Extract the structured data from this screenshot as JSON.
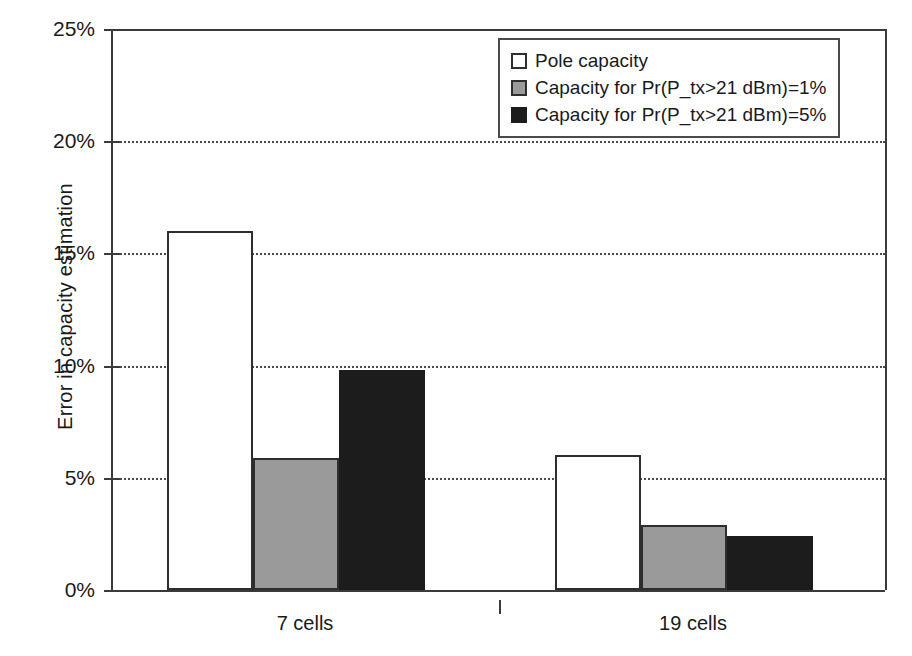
{
  "chart_data": {
    "type": "bar",
    "title": "",
    "subtitle": "",
    "xlabel": "",
    "ylabel": "Error in capacity estimation",
    "categories": [
      "7 cells",
      "19 cells"
    ],
    "series": [
      {
        "name": "Pole capacity",
        "color": "#ffffff",
        "values": [
          16.0,
          6.0
        ]
      },
      {
        "name": "Capacity for Pr(P_tx>21 dBm)=1%",
        "color": "#9a9a9a",
        "values": [
          5.9,
          2.9
        ]
      },
      {
        "name": "Capacity for Pr(P_tx>21 dBm)=5%",
        "color": "#1c1c1c",
        "values": [
          9.8,
          2.4
        ]
      }
    ],
    "ylim": [
      0,
      25
    ],
    "ytick_values": [
      0,
      5,
      10,
      15,
      20,
      25
    ],
    "ytick_labels": [
      "0%",
      "5%",
      "10%",
      "15%",
      "20%",
      "25%"
    ],
    "grid": true,
    "grid_style": "dotted-horizontal",
    "legend_position": "top-right",
    "value_format": "percent"
  },
  "axis": {
    "y_title": "Error in capacity estimation",
    "y_labels": [
      "25%",
      "20%",
      "15%",
      "10%",
      "5%",
      "0%"
    ],
    "x_labels": [
      "7 cells",
      "19 cells"
    ]
  },
  "legend": {
    "entries": [
      {
        "label": "Pole capacity",
        "swatch": "white-square-icon"
      },
      {
        "label": "Capacity for Pr(P_tx>21 dBm)=1%",
        "swatch": "gray-square-icon"
      },
      {
        "label": "Capacity for Pr(P_tx>21 dBm)=5%",
        "swatch": "black-square-icon"
      }
    ]
  },
  "colors": {
    "series_pole": "#ffffff",
    "series_p1": "#9a9a9a",
    "series_p5": "#1c1c1c",
    "axis": "#3a3a3a",
    "grid": "#4a4a4a",
    "text": "#1a1a1a",
    "background": "#ffffff"
  }
}
